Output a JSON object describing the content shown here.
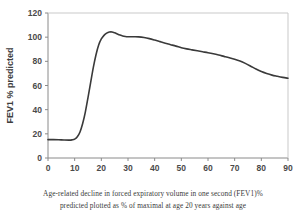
{
  "caption": {
    "line1": "Age-related decline in forced expiratory volume in one second (FEV1)%",
    "line2": "predicted plotted as % of maximal at age 20 years against age"
  },
  "chart_data": {
    "type": "line",
    "title": "",
    "xlabel": "Age in years",
    "ylabel": "FEV1 % predicted",
    "xlim": [
      0,
      90
    ],
    "ylim": [
      0,
      120
    ],
    "xticks": [
      0,
      10,
      20,
      30,
      40,
      50,
      60,
      70,
      80,
      90
    ],
    "yticks": [
      0,
      20,
      40,
      60,
      80,
      100,
      120
    ],
    "xtick_labels": [
      "0",
      "10",
      "20",
      "30",
      "40",
      "50",
      "60",
      "70",
      "80",
      "90"
    ],
    "ytick_labels": [
      "0",
      "20",
      "40",
      "60",
      "80",
      "100",
      "120"
    ],
    "grid": false,
    "legend": false,
    "line_color": "#3a3a3a",
    "line_width": 1.6,
    "series": [
      {
        "name": "FEV1 % predicted",
        "x": [
          0,
          2,
          4,
          6,
          8,
          9,
          10,
          11,
          12,
          13,
          14,
          15,
          16,
          17,
          18,
          19,
          20,
          21,
          22,
          23,
          24,
          25,
          26,
          27,
          28,
          29,
          30,
          32,
          34,
          36,
          38,
          40,
          42,
          44,
          46,
          48,
          50,
          52,
          54,
          56,
          58,
          60,
          62,
          64,
          66,
          68,
          70,
          72,
          74,
          76,
          78,
          80,
          82,
          84,
          86,
          88,
          90
        ],
        "values": [
          15.2,
          15.2,
          15.1,
          14.9,
          14.8,
          15.0,
          15.6,
          17.5,
          21.5,
          28.5,
          38.0,
          50.0,
          62.5,
          75.0,
          85.5,
          93.5,
          98.5,
          101.5,
          103.3,
          104.2,
          104.3,
          103.6,
          102.6,
          101.7,
          101.0,
          100.6,
          100.4,
          100.3,
          100.2,
          99.7,
          98.8,
          97.6,
          96.3,
          95.0,
          93.8,
          92.6,
          91.3,
          90.3,
          89.5,
          88.7,
          87.9,
          87.1,
          86.2,
          85.2,
          84.1,
          83.0,
          81.8,
          80.3,
          78.3,
          76.0,
          73.6,
          71.5,
          69.9,
          68.6,
          67.6,
          66.7,
          66.0
        ]
      }
    ]
  }
}
